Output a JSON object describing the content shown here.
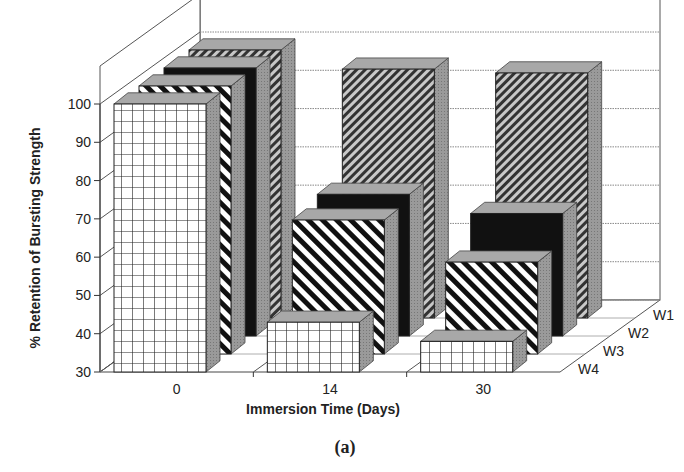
{
  "chart_data": {
    "type": "bar",
    "subtype": "3d-grouped-bar",
    "title": "",
    "caption": "(a)",
    "xlabel": "Immersion Time (Days)",
    "ylabel": "% Retention of Bursting Strength",
    "ylim": [
      30,
      100
    ],
    "yticks": [
      30,
      40,
      50,
      60,
      70,
      80,
      90,
      100
    ],
    "grid": true,
    "categories": [
      "0",
      "14",
      "30"
    ],
    "series": [
      {
        "name": "W1",
        "pattern": "fine-diagonal-hatch",
        "values": [
          100,
          95,
          94
        ]
      },
      {
        "name": "W2",
        "pattern": "solid-black",
        "values": [
          100,
          67,
          62
        ]
      },
      {
        "name": "W3",
        "pattern": "wide-diagonal-stripes",
        "values": [
          100,
          65,
          54
        ]
      },
      {
        "name": "W4",
        "pattern": "grid-crosshatch",
        "values": [
          100,
          43,
          38
        ]
      }
    ],
    "depth_labels": [
      "W1",
      "W2",
      "W3",
      "W4"
    ],
    "legend_position": "depth-axis-right"
  },
  "colors": {
    "side_face": "#9a9a9a",
    "top_face": "#a8a8a8",
    "solid": "#111111",
    "axis": "#333333"
  }
}
